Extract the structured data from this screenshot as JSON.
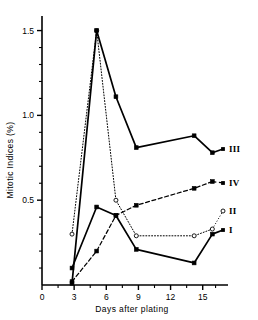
{
  "chart_data": {
    "type": "line",
    "title": "",
    "xlabel": "Days after plating",
    "ylabel": "Mitotic Indices (%)",
    "xlim": [
      0,
      16.8
    ],
    "ylim": [
      0,
      1.58
    ],
    "xticks": [
      0,
      3,
      6,
      9,
      12,
      15
    ],
    "xtick_labels": [
      "0",
      "3",
      "6",
      "9",
      "12",
      "15"
    ],
    "yticks": [
      0.5,
      1.0,
      1.5
    ],
    "ytick_labels": [
      "0.5",
      "1.0",
      "1.5"
    ],
    "y_minor_ticks": [
      0.1,
      0.2,
      0.3,
      0.4,
      0.6,
      0.7,
      0.8,
      0.9,
      1.1,
      1.2,
      1.3,
      1.4
    ],
    "grid": false,
    "legend_position": "right-inline",
    "series": [
      {
        "name": "I",
        "label": "I",
        "line_style": "solid",
        "marker": "square-filled",
        "color": "#000000",
        "x": [
          2.8,
          5.1,
          6.9,
          8.8,
          14.2,
          15.9
        ],
        "y": [
          0.1,
          0.46,
          0.41,
          0.21,
          0.13,
          0.3
        ]
      },
      {
        "name": "II",
        "label": "II",
        "line_style": "dotted",
        "marker": "circle-open",
        "color": "#000000",
        "x": [
          2.8,
          5.1,
          6.9,
          8.8,
          14.2,
          15.9
        ],
        "y": [
          0.3,
          1.5,
          0.5,
          0.29,
          0.29,
          0.33
        ]
      },
      {
        "name": "III",
        "label": "III",
        "line_style": "solid",
        "marker": "square-filled",
        "color": "#000000",
        "x": [
          2.8,
          5.1,
          6.9,
          8.8,
          14.2,
          15.9
        ],
        "y": [
          0.01,
          1.5,
          1.11,
          0.81,
          0.88,
          0.78
        ]
      },
      {
        "name": "IV",
        "label": "IV",
        "line_style": "dashed",
        "marker": "square-filled",
        "color": "#000000",
        "x": [
          2.8,
          5.1,
          6.9,
          8.8,
          14.2,
          15.9
        ],
        "y": [
          0.02,
          0.2,
          0.41,
          0.47,
          0.57,
          0.61
        ]
      }
    ]
  },
  "axes": {
    "x_label": "Days after plating",
    "y_label": "Mitotic Indices (%)"
  }
}
